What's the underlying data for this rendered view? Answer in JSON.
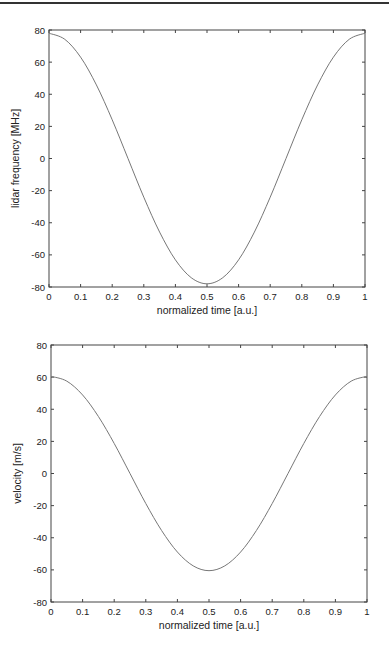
{
  "chart_data": [
    {
      "type": "line",
      "title": "",
      "xlabel": "normalized time [a.u.]",
      "ylabel": "lidar frequency [MHz]",
      "xlim": [
        0,
        1
      ],
      "ylim": [
        -80,
        80
      ],
      "xticks": [
        "0",
        "0.1",
        "0.2",
        "0.3",
        "0.4",
        "0.5",
        "0.6",
        "0.7",
        "0.8",
        "0.9",
        "1"
      ],
      "yticks": [
        "-80",
        "-60",
        "-40",
        "-20",
        "0",
        "20",
        "40",
        "60",
        "80"
      ],
      "grid": false,
      "series": [
        {
          "name": "lidar frequency",
          "color": "#777777",
          "x": [
            0,
            0.05,
            0.1,
            0.15,
            0.2,
            0.25,
            0.3,
            0.35,
            0.4,
            0.45,
            0.5,
            0.55,
            0.6,
            0.65,
            0.7,
            0.75,
            0.8,
            0.85,
            0.9,
            0.95,
            1
          ],
          "y": [
            78,
            74.2,
            63.1,
            45.8,
            24.1,
            0,
            -24.1,
            -45.8,
            -63.1,
            -74.2,
            -78,
            -74.2,
            -63.1,
            -45.8,
            -24.1,
            0,
            24.1,
            45.8,
            63.1,
            74.2,
            78
          ]
        }
      ]
    },
    {
      "type": "line",
      "title": "",
      "xlabel": "normalized time [a.u.]",
      "ylabel": "velocity [m/s]",
      "xlim": [
        0,
        1
      ],
      "ylim": [
        -80,
        80
      ],
      "xticks": [
        "0",
        "0.1",
        "0.2",
        "0.3",
        "0.4",
        "0.5",
        "0.6",
        "0.7",
        "0.8",
        "0.9",
        "1"
      ],
      "yticks": [
        "-80",
        "-60",
        "-40",
        "-20",
        "0",
        "20",
        "40",
        "60",
        "80"
      ],
      "grid": false,
      "series": [
        {
          "name": "velocity",
          "color": "#777777",
          "x": [
            0,
            0.05,
            0.1,
            0.15,
            0.2,
            0.25,
            0.3,
            0.35,
            0.4,
            0.45,
            0.5,
            0.55,
            0.6,
            0.65,
            0.7,
            0.75,
            0.8,
            0.85,
            0.9,
            0.95,
            1
          ],
          "y": [
            60.5,
            57.5,
            48.9,
            35.5,
            18.7,
            0,
            -18.7,
            -35.5,
            -48.9,
            -57.5,
            -60.5,
            -57.5,
            -48.9,
            -35.5,
            -18.7,
            0,
            18.7,
            35.5,
            48.9,
            57.5,
            60.5
          ]
        }
      ]
    }
  ]
}
